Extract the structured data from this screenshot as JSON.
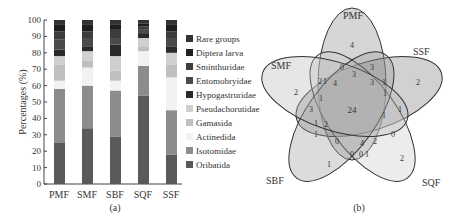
{
  "chart_data": [
    {
      "type": "bar",
      "stacked": true,
      "panel_label": "(a)",
      "title": "",
      "xlabel": "",
      "ylabel": "Percentages (%)",
      "ylim": [
        0,
        100
      ],
      "yticks": [
        0,
        10,
        20,
        30,
        40,
        50,
        60,
        70,
        80,
        90,
        100
      ],
      "grid": false,
      "legend_position": "right",
      "categories": [
        "PMF",
        "SMF",
        "SBF",
        "SQF",
        "SSF"
      ],
      "series": [
        {
          "name": "Oribatida",
          "color": "#5a5a5a",
          "values": [
            25,
            34,
            29,
            54,
            18
          ]
        },
        {
          "name": "Isotomidae",
          "color": "#8c8c8c",
          "values": [
            33,
            26,
            28,
            18,
            27
          ]
        },
        {
          "name": "Actinedida",
          "color": "#f2f2f2",
          "values": [
            5,
            11,
            6,
            9,
            20
          ]
        },
        {
          "name": "Gamasida",
          "color": "#bfbfbf",
          "values": [
            10,
            4,
            6,
            3,
            8
          ]
        },
        {
          "name": "Pseudachorutidae",
          "color": "#d0d0d0",
          "values": [
            5,
            6,
            9,
            5,
            7
          ]
        },
        {
          "name": "Hypogastruridae",
          "color": "#2a2a2a",
          "values": [
            4,
            3,
            7,
            3,
            4
          ]
        },
        {
          "name": "Entomobryidae",
          "color": "#4a4a4a",
          "values": [
            6,
            5,
            4,
            2,
            5
          ]
        },
        {
          "name": "Sminthuridae",
          "color": "#3c3c3c",
          "values": [
            5,
            4,
            5,
            2,
            4
          ]
        },
        {
          "name": "Diptera larva",
          "color": "#1e1e1e",
          "values": [
            4,
            4,
            3,
            2,
            4
          ]
        },
        {
          "name": "Rare groups",
          "color": "#333333",
          "values": [
            3,
            3,
            3,
            2,
            3
          ]
        }
      ],
      "legend_order": [
        "Rare groups",
        "Diptera larva",
        "Sminthuridae",
        "Entomobryidae",
        "Hypogastruridae",
        "Pseudachorutidae",
        "Gamasida",
        "Actinedida",
        "Isotomidae",
        "Oribatida"
      ]
    },
    {
      "type": "venn",
      "panel_label": "(b)",
      "sets": [
        "PMF",
        "SSF",
        "SQF",
        "SBF",
        "SMF"
      ],
      "unique": {
        "PMF": 4,
        "SSF": 2,
        "SQF": 2,
        "SBF": 1,
        "SMF": 2
      },
      "core_all_five": 24,
      "region_values": [
        0,
        3,
        3,
        2,
        1,
        4,
        3,
        1,
        1,
        1,
        3,
        1,
        1,
        2,
        1,
        1,
        0,
        4,
        2,
        0,
        0,
        0,
        1
      ]
    }
  ],
  "panel_a": {
    "ylabel": "Percentages (%)",
    "caption": "(a)",
    "ticks": [
      "0",
      "10",
      "20",
      "30",
      "40",
      "50",
      "60",
      "70",
      "80",
      "90",
      "100"
    ],
    "categories": [
      "PMF",
      "SMF",
      "SBF",
      "SQF",
      "SSF"
    ],
    "legend": [
      "Rare groups",
      "Diptera larva",
      "Sminthuridae",
      "Entomobryidae",
      "Hypogastruridae",
      "Pseudachorutidae",
      "Gamasida",
      "Actinedida",
      "Isotomidae",
      "Oribatida"
    ]
  },
  "panel_b": {
    "caption": "(b)",
    "labels": {
      "PMF": "PMF",
      "SSF": "SSF",
      "SQF": "SQF",
      "SBF": "SBF",
      "SMF": "SMF"
    },
    "numbers": {
      "pmf_only": "4",
      "ssf_only": "2",
      "sqf_only": "2",
      "sbf_only": "1",
      "smf_only": "2",
      "core": "24",
      "n1": "0",
      "n2": "3",
      "n3": "3",
      "n4": "2",
      "n5": "1",
      "n6": "4",
      "n7": "3",
      "n8": "1",
      "n9": "1",
      "n10": "1",
      "n11": "3",
      "n12": "1",
      "n13": "1",
      "n14": "2",
      "n15": "1",
      "n16": "1",
      "n17": "0",
      "n18": "4",
      "n19": "2",
      "n20": "0",
      "n21": "0",
      "n22": "0",
      "n23": "1"
    }
  }
}
